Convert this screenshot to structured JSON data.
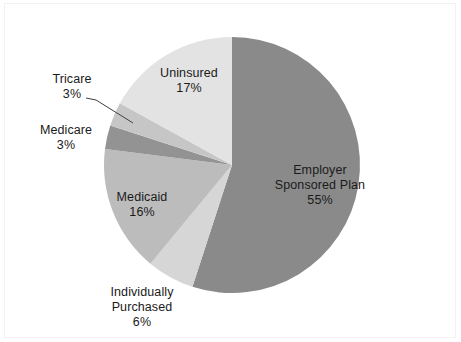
{
  "chart_data": {
    "type": "pie",
    "title": "",
    "subtitle": "",
    "legend_position": "none",
    "grid": false,
    "start_angle_deg": 0,
    "direction": "clockwise",
    "unit": "%",
    "categories": [
      "Employer Sponsored Plan",
      "Individually Purchased",
      "Medicaid",
      "Medicare",
      "Tricare",
      "Uninsured"
    ],
    "values": [
      55,
      6,
      16,
      3,
      3,
      17
    ],
    "slices": [
      {
        "label": "Employer Sponsored Plan",
        "label_line1": "Employer",
        "label_line2": "Sponsored Plan",
        "value": 55,
        "value_text": "55%",
        "color": "#8a8a8a",
        "label_placement": "inside"
      },
      {
        "label": "Individually Purchased",
        "label_line1": "Individually",
        "label_line2": "Purchased",
        "value": 6,
        "value_text": "6%",
        "color": "#d6d6d6",
        "label_placement": "outside"
      },
      {
        "label": "Medicaid",
        "label_line1": "Medicaid",
        "label_line2": "",
        "value": 16,
        "value_text": "16%",
        "color": "#bcbcbc",
        "label_placement": "inside"
      },
      {
        "label": "Medicare",
        "label_line1": "Medicare",
        "label_line2": "",
        "value": 3,
        "value_text": "3%",
        "color": "#939393",
        "label_placement": "outside"
      },
      {
        "label": "Tricare",
        "label_line1": "Tricare",
        "label_line2": "",
        "value": 3,
        "value_text": "3%",
        "color": "#c6c6c6",
        "label_placement": "outside-leader"
      },
      {
        "label": "Uninsured",
        "label_line1": "Uninsured",
        "label_line2": "",
        "value": 17,
        "value_text": "17%",
        "color": "#e3e3e3",
        "label_placement": "inside"
      }
    ],
    "xlabel": "",
    "ylabel": ""
  },
  "colors": {
    "background": "#ffffff",
    "frame_border": "#f2f2f2",
    "text": "#1a1a1a",
    "leader_line": "#404040"
  }
}
